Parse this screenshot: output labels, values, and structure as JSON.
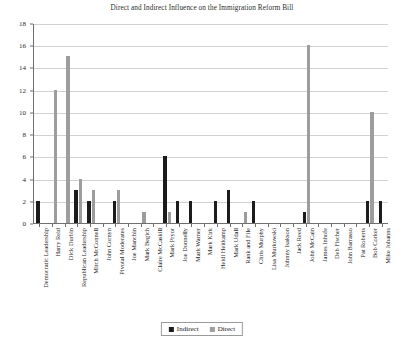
{
  "chart_data": {
    "type": "bar",
    "title": "Direct and Indirect Influence on the Immigration Reform Bill",
    "xlabel": "",
    "ylabel": "",
    "ylim": [
      0,
      18
    ],
    "ytick_values": [
      0,
      2,
      4,
      6,
      8,
      10,
      12,
      14,
      16,
      18
    ],
    "grid": true,
    "legend_position": "bottom",
    "categories": [
      "Democratic Leadership",
      "Harry Reid",
      "Dick Durbin",
      "Republican Leadership",
      "Mitch McConnell",
      "John Cornyn",
      "Pivotal Moderates",
      "Joe Manchin",
      "Mark Begich",
      "Claire McCaskill",
      "Mark Pryor",
      "Joe Donnelly",
      "Mark Warner",
      "Mark Kirk",
      "Heidi Heitkamp",
      "Mark Udall",
      "Rank and File",
      "Chris Murphy",
      "Lisa Murkowski",
      "Johnny Isakson",
      "Jack Reed",
      "John McCain",
      "James Inhofe",
      "Deb Fischer",
      "John Barrasso",
      "Pat Roberts",
      "Bob Corker",
      "Mike Johanns"
    ],
    "series": [
      {
        "name": "Indirect",
        "color": "#1c1c1c",
        "values": [
          2,
          0,
          0,
          3,
          2,
          0,
          2,
          0,
          0,
          0,
          6,
          2,
          2,
          0,
          2,
          3,
          0,
          2,
          0,
          0,
          0,
          1,
          0,
          0,
          0,
          0,
          2,
          2
        ]
      },
      {
        "name": "Direct",
        "color": "#9d9d9d",
        "values": [
          0,
          12,
          15,
          4,
          3,
          0,
          3,
          0,
          1,
          0,
          1,
          0,
          0,
          0,
          0,
          0,
          1,
          0,
          0,
          0,
          0,
          16,
          0,
          0,
          0,
          0,
          10,
          0
        ]
      }
    ]
  },
  "legend": {
    "items": [
      {
        "label": "Indirect",
        "swatch": "indirect"
      },
      {
        "label": "Direct",
        "swatch": "direct"
      }
    ]
  }
}
